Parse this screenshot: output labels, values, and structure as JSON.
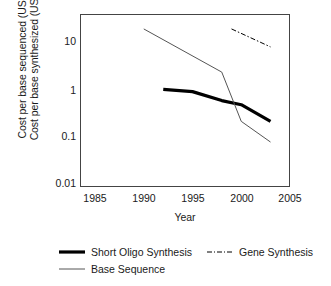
{
  "chart_data": {
    "type": "line",
    "title": "",
    "xlabel": "Year",
    "ylabel_lines": [
      "Cost per base sequenced (USD)",
      "Cost per base synthesized (USD)"
    ],
    "xlim": [
      1985,
      2005
    ],
    "ylim": [
      0.01,
      20
    ],
    "yscale": "log",
    "grid": false,
    "legend_position": "bottom",
    "xticks": [
      "1985",
      "1990",
      "1995",
      "2000",
      "2005"
    ],
    "xtick_values": [
      1985,
      1990,
      1995,
      2000,
      2005
    ],
    "yticks": [
      "10",
      "1",
      "0.1",
      "0.01"
    ],
    "ytick_values": [
      10,
      1,
      0.1,
      0.01
    ],
    "series": [
      {
        "name": "Short Oligo Synthesis",
        "style": "thick-solid",
        "color": "#000000",
        "width": 3.2,
        "x": [
          1992,
          1995,
          1998,
          2000,
          2003
        ],
        "y": [
          0.95,
          0.85,
          0.55,
          0.45,
          0.2
        ]
      },
      {
        "name": "Gene Synthesis",
        "style": "dash-dot",
        "color": "#000000",
        "width": 1.0,
        "x": [
          1999,
          2003
        ],
        "y": [
          18,
          7.5
        ]
      },
      {
        "name": "Base Sequence",
        "style": "thin-solid",
        "color": "#555555",
        "width": 1.0,
        "x": [
          1990,
          1998,
          2000,
          2003
        ],
        "y": [
          18,
          2.2,
          0.2,
          0.073
        ]
      }
    ]
  },
  "legend": {
    "items": [
      {
        "label": "Short Oligo Synthesis",
        "style": "thick-solid"
      },
      {
        "label": "Gene Synthesis",
        "style": "dash-dot"
      },
      {
        "label": "Base Sequence",
        "style": "thin-solid"
      }
    ]
  },
  "axis": {
    "xlabel": "Year",
    "ylabel_line1": "Cost per base sequenced (USD)",
    "ylabel_line2": "Cost per base synthesized (USD)"
  }
}
